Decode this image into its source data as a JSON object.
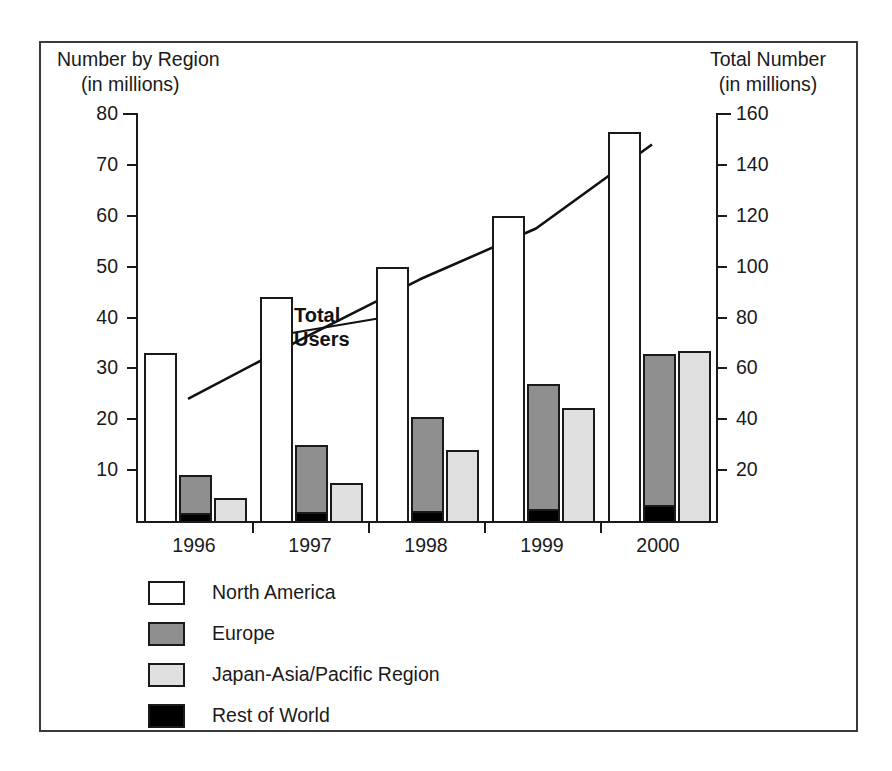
{
  "chart_data": {
    "type": "bar",
    "title": "",
    "categories": [
      "1996",
      "1997",
      "1998",
      "1999",
      "2000"
    ],
    "left_axis": {
      "label_line1": "Number by Region",
      "label_line2": "(in millions)",
      "ticks": [
        10,
        20,
        30,
        40,
        50,
        60,
        70,
        80
      ],
      "ylim": [
        0,
        80
      ]
    },
    "right_axis": {
      "label_line1": "Total Number",
      "label_line2": "(in millions)",
      "ticks": [
        20,
        40,
        60,
        80,
        100,
        120,
        140,
        160
      ],
      "ylim": [
        0,
        160
      ]
    },
    "grid": false,
    "legend_position": "below-plot",
    "series": [
      {
        "name": "North America",
        "color": "#ffffff",
        "values": [
          33,
          44,
          50,
          60,
          76.5
        ]
      },
      {
        "name": "Europe",
        "color": "#8f8f8f",
        "values": [
          9,
          15,
          20.5,
          27,
          32.8
        ]
      },
      {
        "name": "Japan-Asia/Pacific Region",
        "color": "#e0e0e0",
        "values": [
          4.5,
          7.5,
          14,
          22.3,
          33.5
        ]
      },
      {
        "name": "Rest of World",
        "color": "#000000",
        "values": [
          1.5,
          1.8,
          2.0,
          2.4,
          3.2
        ]
      }
    ],
    "overlay_line": {
      "name": "Total Users",
      "axis": "right",
      "annotation_line1": "Total",
      "annotation_line2": "Users",
      "values": [
        48,
        72,
        95,
        115,
        148
      ]
    }
  },
  "axes": {
    "left_title_l1": "Number by Region",
    "left_title_l2": "(in millions)",
    "right_title_l1": "Total Number",
    "right_title_l2": "(in millions)",
    "left_ticks": [
      "10",
      "20",
      "30",
      "40",
      "50",
      "60",
      "70",
      "80"
    ],
    "right_ticks": [
      "20",
      "40",
      "60",
      "80",
      "100",
      "120",
      "140",
      "160"
    ],
    "x_labels": [
      "1996",
      "1997",
      "1998",
      "1999",
      "2000"
    ]
  },
  "annotation": {
    "line1": "Total",
    "line2": "Users"
  },
  "legend": {
    "items": [
      {
        "label": "North America",
        "color": "#ffffff"
      },
      {
        "label": "Europe",
        "color": "#8f8f8f"
      },
      {
        "label": "Japan-Asia/Pacific Region",
        "color": "#e0e0e0"
      },
      {
        "label": "Rest of World",
        "color": "#000000"
      }
    ]
  }
}
